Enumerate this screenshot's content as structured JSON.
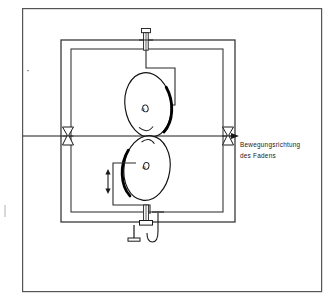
{
  "figure": {
    "background_color": "#ffffff",
    "line_color": "#333333",
    "heavy_line_color": "#000000",
    "border": {
      "name": "figure-border",
      "x": 22,
      "y": 8,
      "width": 300,
      "height": 284,
      "stroke": "#555555",
      "stroke_width": 1.2
    },
    "annotation": {
      "name": "motion-direction-label",
      "line1": "Bewegungsrichtung",
      "line2": "des Fadens",
      "x": 240,
      "y1": 144,
      "y2": 155,
      "font_size": 6.4,
      "color": "#1a1a1a"
    },
    "thread_axis": {
      "name": "thread-line",
      "x_start": 23,
      "x_end": 232,
      "y": 136,
      "arrow_tip_x": 236,
      "stroke": "#1a1a1a",
      "stroke_width": 1.0
    },
    "outer_frame": {
      "name": "outer-frame-rect",
      "x": 61,
      "y": 40,
      "width": 174,
      "height": 182,
      "stroke": "#3a3a3a",
      "stroke_width": 1.3
    },
    "inner_frame": {
      "name": "inner-frame-rect",
      "x": 71,
      "y": 49,
      "width": 152,
      "height": 163,
      "stroke": "#3a3a3a",
      "stroke_width": 1.1
    },
    "upper_disc": {
      "name": "upper-tension-disc",
      "cx": 148,
      "cy": 105,
      "rx": 23,
      "ry": 32,
      "rotation": -8,
      "hub_label": "o",
      "hub_cx": 145,
      "hub_cy": 108,
      "hub_rx": 2.6,
      "hub_ry": 3.4,
      "heavy_edge": "right",
      "stroke": "#111111",
      "stroke_width": 1.1,
      "heavy_stroke_width": 2.6
    },
    "lower_disc": {
      "name": "lower-tension-disc",
      "cx": 147,
      "cy": 168,
      "rx": 23,
      "ry": 32,
      "rotation": 8,
      "hub_label": "o",
      "hub_cx": 145,
      "hub_cy": 165,
      "hub_rx": 2.6,
      "hub_ry": 3.4,
      "heavy_edge": "left",
      "stroke": "#111111",
      "stroke_width": 1.1,
      "heavy_stroke_width": 2.6
    },
    "thread_guides": [
      {
        "name": "thread-guide-left",
        "cx": 68,
        "cy": 136,
        "half_width": 5.5,
        "half_height": 9,
        "stroke": "#1a1a1a",
        "stroke_width": 1.0
      },
      {
        "name": "thread-guide-right",
        "cx": 228,
        "cy": 136,
        "half_width": 5.5,
        "half_height": 9,
        "stroke": "#1a1a1a",
        "stroke_width": 1.0
      }
    ],
    "top_bolt": {
      "name": "top-adjustment-bolt",
      "cx": 146,
      "head_y": 31,
      "head_width": 9,
      "head_height": 5,
      "shank_top": 36,
      "shank_bottom": 50,
      "shank_width": 4,
      "stroke": "#1a1a1a"
    },
    "top_bracket": {
      "name": "upper-disc-bracket",
      "points": "146,50 146,68 175,68 175,105 160,105",
      "stroke": "#2a2a2a",
      "stroke_width": 1.1
    },
    "bottom_bracket": {
      "name": "lower-disc-bracket",
      "points": "136,163 113,163 113,205 150,205 150,214",
      "stroke": "#2a2a2a",
      "stroke_width": 1.1
    },
    "adjust_arrow": {
      "name": "adjustment-double-arrow",
      "x": 108,
      "y_top": 171,
      "y_bottom": 192,
      "stroke": "#1a1a1a",
      "stroke_width": 1.1
    },
    "bottom_assembly": {
      "name": "bottom-mount-assembly",
      "stem_x": 146,
      "stem_top": 205,
      "stem_bottom": 226,
      "nut_y": 222,
      "nut_width": 12,
      "nut_height": 5,
      "pin_x": 134,
      "pin_top": 226,
      "pin_bottom": 240,
      "foot_y": 240,
      "foot_width": 13,
      "hook_x": 158,
      "hook_top": 214,
      "hook_bottom": 243,
      "stroke": "#1a1a1a"
    },
    "dust_specks": [
      {
        "name": "speck-upper-left",
        "x": 27,
        "y": 70,
        "w": 2,
        "h": 1
      },
      {
        "name": "speck-lower-left",
        "x": 4,
        "y": 205,
        "w": 2,
        "h": 12
      }
    ]
  }
}
